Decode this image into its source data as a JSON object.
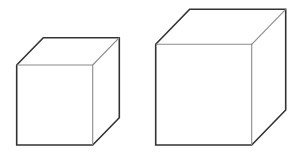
{
  "diagram": {
    "colors": {
      "background": "#ffffff",
      "outline": "#333333",
      "inner_edge": "#8a8a8a"
    },
    "cubes": [
      {
        "name": "small-cube",
        "front": {
          "x1": 16.7,
          "y1": 65,
          "x2": 92.7,
          "y2": 145
        },
        "depth": {
          "dx": 26.6,
          "dy": -27.3
        }
      },
      {
        "name": "large-cube",
        "front": {
          "x1": 155.7,
          "y1": 44.3,
          "x2": 251.7,
          "y2": 145
        },
        "depth": {
          "dx": 34.0,
          "dy": -35.0
        }
      }
    ]
  }
}
